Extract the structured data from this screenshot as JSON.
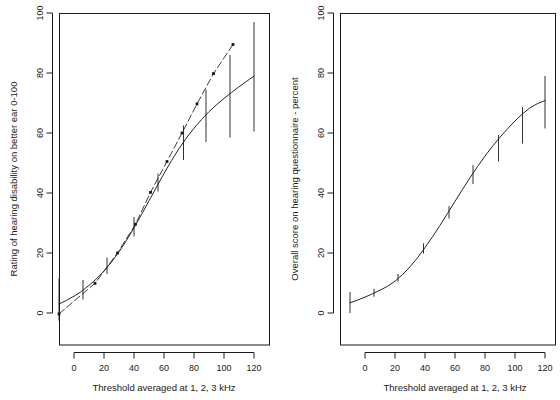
{
  "figure": {
    "width": 560,
    "height": 400,
    "background": "#ffffff",
    "line_color": "#1a1a1a",
    "panel_count": 2
  },
  "chart_data": [
    {
      "type": "line",
      "panel": "left",
      "title": "",
      "subtitle": "",
      "xlabel": "Threshold averaged at 1, 2, 3 kHz",
      "ylabel": "Rating of hearing disability on better ear 0-100",
      "xlim": [
        -16,
        134
      ],
      "ylim": [
        -4,
        104
      ],
      "xticks": [
        0,
        20,
        40,
        60,
        80,
        100,
        120
      ],
      "yticks": [
        0,
        20,
        40,
        60,
        80,
        100
      ],
      "xticklabels": [
        "0",
        "20",
        "40",
        "60",
        "80",
        "100",
        "120"
      ],
      "yticklabels": [
        "0",
        "20",
        "40",
        "60",
        "80",
        "100"
      ],
      "grid": false,
      "legend": "none",
      "series": [
        {
          "name": "Fitted curve with 95% confidence intervals",
          "style": "solid",
          "marker": "none",
          "x": [
            -10,
            -5,
            0,
            5,
            10,
            15,
            20,
            25,
            30,
            35,
            40,
            45,
            50,
            55,
            60,
            65,
            70,
            75,
            80,
            85,
            90,
            95,
            100,
            105,
            110,
            115,
            120
          ],
          "y": [
            3.0,
            4.2,
            5.6,
            7.2,
            9.2,
            11.4,
            14.0,
            17.0,
            20.4,
            24.2,
            28.4,
            32.8,
            37.4,
            42.0,
            46.5,
            50.8,
            54.8,
            58.4,
            61.6,
            64.5,
            67.1,
            69.4,
            71.5,
            73.5,
            75.4,
            77.2,
            79.0
          ]
        },
        {
          "name": "Observed group means",
          "style": "dashed-with-points",
          "marker": "square",
          "x": [
            -10,
            14,
            29,
            41,
            51,
            62,
            72,
            82,
            93,
            106
          ],
          "y": [
            -0.3,
            9.9,
            20.0,
            29.6,
            40.2,
            50.5,
            60.0,
            69.7,
            79.8,
            89.5
          ]
        }
      ],
      "error_bars": [
        {
          "x": -10,
          "y": 3.0,
          "low": -2.5,
          "high": 11.5
        },
        {
          "x": 6,
          "y": 7.6,
          "low": 4.5,
          "high": 11.0
        },
        {
          "x": 22,
          "y": 15.5,
          "low": 13.0,
          "high": 18.5
        },
        {
          "x": 40,
          "y": 28.4,
          "low": 25.5,
          "high": 32.0
        },
        {
          "x": 56,
          "y": 43.0,
          "low": 40.5,
          "high": 46.5
        },
        {
          "x": 73,
          "y": 56.5,
          "low": 51.0,
          "high": 62.5
        },
        {
          "x": 88,
          "y": 65.4,
          "low": 57.0,
          "high": 74.5
        },
        {
          "x": 104,
          "y": 72.5,
          "low": 58.5,
          "high": 86.0
        },
        {
          "x": 120,
          "y": 79.0,
          "low": 60.5,
          "high": 97.0
        }
      ]
    },
    {
      "type": "line",
      "panel": "right",
      "title": "",
      "subtitle": "",
      "xlabel": "Threshold averaged at 1, 2, 3 kHz",
      "ylabel": "Overall score on hearing questionnaire - percent",
      "xlim": [
        -16,
        134
      ],
      "ylim": [
        -4,
        104
      ],
      "xticks": [
        0,
        20,
        40,
        60,
        80,
        100,
        120
      ],
      "yticks": [
        0,
        20,
        40,
        60,
        80,
        100
      ],
      "xticklabels": [
        "0",
        "20",
        "40",
        "60",
        "80",
        "100",
        "120"
      ],
      "yticklabels": [
        "0",
        "20",
        "40",
        "60",
        "80",
        "100"
      ],
      "grid": false,
      "legend": "none",
      "series": [
        {
          "name": "Fitted curve with 95% confidence intervals",
          "style": "solid",
          "marker": "none",
          "x": [
            -10,
            -5,
            0,
            5,
            10,
            15,
            20,
            25,
            30,
            35,
            40,
            45,
            50,
            55,
            60,
            65,
            70,
            75,
            80,
            85,
            90,
            95,
            100,
            105,
            110,
            115,
            120
          ],
          "y": [
            3.4,
            4.3,
            5.3,
            6.4,
            7.6,
            8.9,
            10.6,
            12.8,
            15.4,
            18.4,
            21.8,
            25.4,
            29.2,
            33.2,
            37.2,
            41.2,
            45.1,
            48.8,
            52.3,
            55.6,
            58.6,
            61.4,
            64.0,
            66.4,
            68.4,
            69.8,
            70.8
          ]
        }
      ],
      "error_bars": [
        {
          "x": -10,
          "y": 3.4,
          "low": 0.0,
          "high": 7.0
        },
        {
          "x": 6,
          "y": 6.7,
          "low": 5.4,
          "high": 8.0
        },
        {
          "x": 22,
          "y": 11.7,
          "low": 10.5,
          "high": 13.0
        },
        {
          "x": 39,
          "y": 21.4,
          "low": 19.8,
          "high": 23.2
        },
        {
          "x": 56,
          "y": 33.6,
          "low": 31.5,
          "high": 35.6
        },
        {
          "x": 72,
          "y": 46.1,
          "low": 43.0,
          "high": 49.3
        },
        {
          "x": 89,
          "y": 54.9,
          "low": 50.5,
          "high": 59.3
        },
        {
          "x": 105,
          "y": 62.6,
          "low": 56.5,
          "high": 68.6
        },
        {
          "x": 120,
          "y": 70.8,
          "low": 61.5,
          "high": 79.0
        }
      ]
    }
  ],
  "panels": {
    "left": {
      "name": "hearing-disability-rating-plot",
      "xlabel": "Threshold averaged at 1, 2, 3 kHz",
      "ylabel": "Rating of hearing disability on better ear 0-100",
      "xticklabels": [
        "0",
        "20",
        "40",
        "60",
        "80",
        "100",
        "120"
      ],
      "yticklabels": [
        "0",
        "20",
        "40",
        "60",
        "80",
        "100"
      ]
    },
    "right": {
      "name": "hearing-questionnaire-score-plot",
      "xlabel": "Threshold averaged at 1, 2, 3 kHz",
      "ylabel": "Overall score on hearing questionnaire - percent",
      "xticklabels": [
        "0",
        "20",
        "40",
        "60",
        "80",
        "100",
        "120"
      ],
      "yticklabels": [
        "0",
        "20",
        "40",
        "60",
        "80",
        "100"
      ]
    }
  }
}
